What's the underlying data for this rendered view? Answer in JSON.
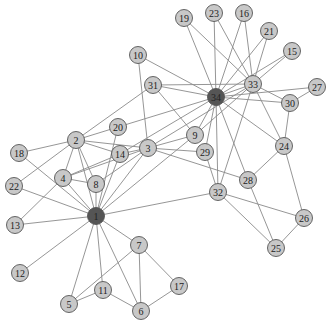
{
  "chart_data": {
    "type": "network",
    "title": "",
    "node_colors": {
      "default": "#c8c8c8",
      "highlight": "#555555"
    },
    "edge_color": "#8a8a8a",
    "nodes": [
      {
        "id": "1",
        "x": 96,
        "y": 216,
        "highlight": true
      },
      {
        "id": "2",
        "x": 76,
        "y": 140
      },
      {
        "id": "3",
        "x": 148,
        "y": 148
      },
      {
        "id": "4",
        "x": 63,
        "y": 178
      },
      {
        "id": "5",
        "x": 69,
        "y": 304
      },
      {
        "id": "6",
        "x": 141,
        "y": 311
      },
      {
        "id": "7",
        "x": 139,
        "y": 245
      },
      {
        "id": "8",
        "x": 96,
        "y": 184
      },
      {
        "id": "9",
        "x": 195,
        "y": 135
      },
      {
        "id": "10",
        "x": 138,
        "y": 55
      },
      {
        "id": "11",
        "x": 103,
        "y": 290
      },
      {
        "id": "12",
        "x": 20,
        "y": 273
      },
      {
        "id": "13",
        "x": 15,
        "y": 225
      },
      {
        "id": "14",
        "x": 120,
        "y": 154
      },
      {
        "id": "15",
        "x": 292,
        "y": 51
      },
      {
        "id": "16",
        "x": 244,
        "y": 13
      },
      {
        "id": "17",
        "x": 179,
        "y": 286
      },
      {
        "id": "18",
        "x": 19,
        "y": 153
      },
      {
        "id": "19",
        "x": 184,
        "y": 18
      },
      {
        "id": "20",
        "x": 118,
        "y": 127
      },
      {
        "id": "21",
        "x": 269,
        "y": 31
      },
      {
        "id": "22",
        "x": 14,
        "y": 186
      },
      {
        "id": "23",
        "x": 214,
        "y": 13
      },
      {
        "id": "24",
        "x": 284,
        "y": 146
      },
      {
        "id": "25",
        "x": 276,
        "y": 248
      },
      {
        "id": "26",
        "x": 304,
        "y": 218
      },
      {
        "id": "27",
        "x": 317,
        "y": 87
      },
      {
        "id": "28",
        "x": 248,
        "y": 180
      },
      {
        "id": "29",
        "x": 205,
        "y": 152
      },
      {
        "id": "30",
        "x": 290,
        "y": 103
      },
      {
        "id": "31",
        "x": 153,
        "y": 85
      },
      {
        "id": "32",
        "x": 218,
        "y": 192
      },
      {
        "id": "33",
        "x": 253,
        "y": 84
      },
      {
        "id": "34",
        "x": 216,
        "y": 97,
        "highlight": true
      }
    ],
    "edges": [
      [
        "1",
        "2"
      ],
      [
        "1",
        "3"
      ],
      [
        "1",
        "4"
      ],
      [
        "1",
        "5"
      ],
      [
        "1",
        "6"
      ],
      [
        "1",
        "7"
      ],
      [
        "1",
        "8"
      ],
      [
        "1",
        "9"
      ],
      [
        "1",
        "11"
      ],
      [
        "1",
        "12"
      ],
      [
        "1",
        "13"
      ],
      [
        "1",
        "14"
      ],
      [
        "1",
        "18"
      ],
      [
        "1",
        "20"
      ],
      [
        "1",
        "22"
      ],
      [
        "1",
        "32"
      ],
      [
        "2",
        "3"
      ],
      [
        "2",
        "4"
      ],
      [
        "2",
        "8"
      ],
      [
        "2",
        "14"
      ],
      [
        "2",
        "18"
      ],
      [
        "2",
        "20"
      ],
      [
        "2",
        "22"
      ],
      [
        "2",
        "31"
      ],
      [
        "3",
        "4"
      ],
      [
        "3",
        "8"
      ],
      [
        "3",
        "9"
      ],
      [
        "3",
        "10"
      ],
      [
        "3",
        "14"
      ],
      [
        "3",
        "28"
      ],
      [
        "3",
        "29"
      ],
      [
        "3",
        "33"
      ],
      [
        "4",
        "8"
      ],
      [
        "4",
        "13"
      ],
      [
        "4",
        "14"
      ],
      [
        "5",
        "7"
      ],
      [
        "5",
        "11"
      ],
      [
        "6",
        "7"
      ],
      [
        "6",
        "11"
      ],
      [
        "6",
        "17"
      ],
      [
        "7",
        "17"
      ],
      [
        "9",
        "31"
      ],
      [
        "9",
        "33"
      ],
      [
        "9",
        "34"
      ],
      [
        "10",
        "34"
      ],
      [
        "14",
        "34"
      ],
      [
        "15",
        "33"
      ],
      [
        "15",
        "34"
      ],
      [
        "16",
        "33"
      ],
      [
        "16",
        "34"
      ],
      [
        "19",
        "33"
      ],
      [
        "19",
        "34"
      ],
      [
        "20",
        "34"
      ],
      [
        "21",
        "33"
      ],
      [
        "21",
        "34"
      ],
      [
        "23",
        "33"
      ],
      [
        "23",
        "34"
      ],
      [
        "24",
        "26"
      ],
      [
        "24",
        "28"
      ],
      [
        "24",
        "30"
      ],
      [
        "24",
        "33"
      ],
      [
        "24",
        "34"
      ],
      [
        "25",
        "26"
      ],
      [
        "25",
        "28"
      ],
      [
        "25",
        "32"
      ],
      [
        "26",
        "32"
      ],
      [
        "27",
        "30"
      ],
      [
        "27",
        "34"
      ],
      [
        "28",
        "34"
      ],
      [
        "29",
        "32"
      ],
      [
        "29",
        "34"
      ],
      [
        "30",
        "33"
      ],
      [
        "30",
        "34"
      ],
      [
        "31",
        "33"
      ],
      [
        "31",
        "34"
      ],
      [
        "32",
        "33"
      ],
      [
        "32",
        "34"
      ],
      [
        "33",
        "34"
      ]
    ],
    "node_radius": 8.5
  }
}
